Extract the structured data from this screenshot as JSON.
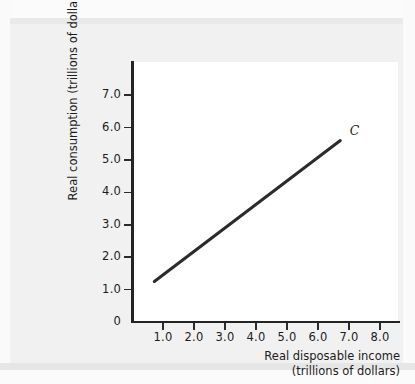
{
  "chart_data": {
    "type": "line",
    "title": "",
    "subtitle": "",
    "xlabel_line1": "Real disposable income",
    "xlabel_line2": "(trillions of dollars)",
    "ylabel": "Real consumption (trillions of dollars)",
    "xlim": [
      0,
      8.65
    ],
    "ylim": [
      0,
      7.9
    ],
    "grid": false,
    "legend_position": "inline-annotation",
    "xticks": [
      "1.0",
      "2.0",
      "3.0",
      "4.0",
      "5.0",
      "6.0",
      "7.0",
      "8.0"
    ],
    "xtick_values": [
      1.0,
      2.0,
      3.0,
      4.0,
      5.0,
      6.0,
      7.0,
      8.0
    ],
    "yticks": [
      "0",
      "1.0",
      "2.0",
      "3.0",
      "4.0",
      "5.0",
      "6.0",
      "7.0"
    ],
    "ytick_values": [
      0,
      1.0,
      2.0,
      3.0,
      4.0,
      5.0,
      6.0,
      7.0
    ],
    "series": [
      {
        "name": "C",
        "annotation": "C",
        "color": "#2b2b2b",
        "linewidth": 3,
        "x": [
          0.72,
          6.72
        ],
        "y": [
          1.25,
          5.6
        ]
      }
    ],
    "annotations": [
      {
        "text": "C",
        "x": 7.15,
        "y": 5.85
      }
    ]
  },
  "figure": {
    "background": "#f1f1f1",
    "plot_background": "#ffffff",
    "axis_color": "#242424",
    "text_color": "#1c1c1c"
  }
}
